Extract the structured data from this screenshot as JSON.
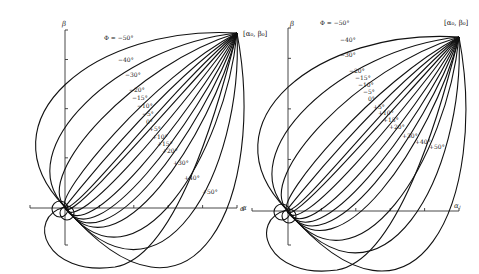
{
  "figure": {
    "panels": [
      {
        "id": "left",
        "origin": [
          65,
          207
        ],
        "target": [
          237,
          33
        ],
        "target_label": "[α₀, β₀]",
        "target_label_pos": [
          243,
          36
        ],
        "beta_axis": {
          "x": 65,
          "y_top": 30,
          "y_bottom": 245,
          "label": "β",
          "label_pos": [
            62,
            26
          ]
        },
        "alpha_axis": {
          "y": 208,
          "x_left": 30,
          "x_right": 237,
          "label": "α",
          "label_pos": [
            240,
            211
          ]
        },
        "phi_label_prefix": "Φ = ",
        "curves": [
          {
            "phi": "-50°",
            "label": "Φ = −50°",
            "label_pos": [
              104,
              40
            ],
            "bulge": 150
          },
          {
            "phi": "-40°",
            "label": "−40°",
            "label_pos": [
              118,
              62
            ],
            "bulge": 112
          },
          {
            "phi": "-30°",
            "label": "−30°",
            "label_pos": [
              125,
              77
            ],
            "bulge": 84
          },
          {
            "phi": "-20°",
            "label": "−20°",
            "label_pos": [
              129,
              92
            ],
            "bulge": 60
          },
          {
            "phi": "-15°",
            "label": "−15°",
            "label_pos": [
              132,
              100
            ],
            "bulge": 48
          },
          {
            "phi": "-10°",
            "label": "−10°",
            "label_pos": [
              137,
              108
            ],
            "bulge": 37
          },
          {
            "phi": "-5°",
            "label": "−5°",
            "label_pos": [
              142,
              116
            ],
            "bulge": 26
          },
          {
            "phi": "0°",
            "label": "0°",
            "label_pos": [
              146,
              124
            ],
            "bulge": 14
          },
          {
            "phi": "+5°",
            "label": "+5°",
            "label_pos": [
              149,
              131
            ],
            "bulge": 3
          },
          {
            "phi": "+10°",
            "label": "+10°",
            "label_pos": [
              152,
              139
            ],
            "bulge": -9
          },
          {
            "phi": "+15°",
            "label": "+15°",
            "label_pos": [
              157,
              146
            ],
            "bulge": -20
          },
          {
            "phi": "+20°",
            "label": "+20°",
            "label_pos": [
              162,
              153
            ],
            "bulge": -32
          },
          {
            "phi": "+30°",
            "label": "+30°",
            "label_pos": [
              173,
              165
            ],
            "bulge": -56
          },
          {
            "phi": "+40°",
            "label": "+40°",
            "label_pos": [
              184,
              180
            ],
            "bulge": -84
          },
          {
            "phi": "+50°",
            "label": "+50°",
            "label_pos": [
              202,
              194
            ],
            "bulge": -118
          }
        ]
      },
      {
        "id": "right",
        "origin": [
          287,
          210
        ],
        "target": [
          459,
          37
        ],
        "target_label": "[α₀, β₀]",
        "target_label_pos": [
          444,
          25
        ],
        "beta_axis": {
          "x": 288,
          "y_top": 28,
          "y_bottom": 245,
          "label": "β",
          "label_pos": [
            290,
            26
          ]
        },
        "alpha_axis": {
          "y": 211,
          "x_left": 252,
          "x_right": 459,
          "label": "αⱼ",
          "label_pos": [
            454,
            208
          ]
        },
        "left_marker": {
          "label": "α",
          "pos": [
            242,
            210
          ]
        },
        "phi_label_prefix": "Φ = ",
        "curves": [
          {
            "phi": "-50°",
            "label": "Φ = −50°",
            "label_pos": [
              320,
              25
            ],
            "bulge": 150
          },
          {
            "phi": "-40°",
            "label": "−40°",
            "label_pos": [
              340,
              42
            ],
            "bulge": 112
          },
          {
            "phi": "-30°",
            "label": "−30°",
            "label_pos": [
              340,
              57
            ],
            "bulge": 84
          },
          {
            "phi": "-20°",
            "label": "−20°",
            "label_pos": [
              349,
              73
            ],
            "bulge": 60
          },
          {
            "phi": "-15°",
            "label": "−15°",
            "label_pos": [
              355,
              80
            ],
            "bulge": 48
          },
          {
            "phi": "-10°",
            "label": "−10°",
            "label_pos": [
              358,
              87
            ],
            "bulge": 37
          },
          {
            "phi": "-5°",
            "label": "−5°",
            "label_pos": [
              363,
              94
            ],
            "bulge": 26
          },
          {
            "phi": "0°",
            "label": "0°",
            "label_pos": [
              368,
              101
            ],
            "bulge": 14
          },
          {
            "phi": "+5°",
            "label": "+5°",
            "label_pos": [
              373,
              109
            ],
            "bulge": 3
          },
          {
            "phi": "+10°",
            "label": "+10°",
            "label_pos": [
              378,
              115
            ],
            "bulge": -9
          },
          {
            "phi": "+15°",
            "label": "+15°",
            "label_pos": [
              383,
              122
            ],
            "bulge": -20
          },
          {
            "phi": "+20°",
            "label": "+20°",
            "label_pos": [
              389,
              129
            ],
            "bulge": -32
          },
          {
            "phi": "+30°",
            "label": "+30°",
            "label_pos": [
              402,
              138
            ],
            "bulge": -56
          },
          {
            "phi": "+40°",
            "label": "+40°",
            "label_pos": [
              415,
              144
            ],
            "bulge": -84
          },
          {
            "phi": "+50°",
            "label": "+50°",
            "label_pos": [
              429,
              149
            ],
            "bulge": -118
          }
        ]
      }
    ]
  }
}
